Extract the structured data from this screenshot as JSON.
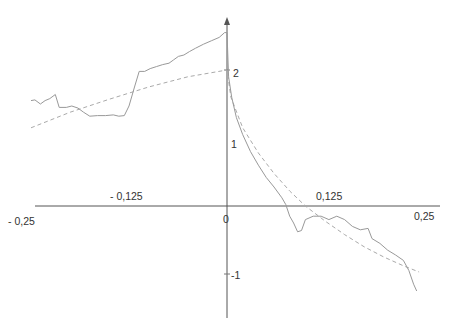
{
  "chart_data": {
    "type": "line",
    "title": "",
    "xlabel": "",
    "ylabel": "",
    "xlim": [
      -0.25,
      0.25
    ],
    "ylim": [
      -1.4,
      2.6
    ],
    "grid": false,
    "legend": null,
    "x_tick_labels": [
      "- 0,25",
      "- 0,125",
      "0",
      "0,125",
      "0,25"
    ],
    "y_tick_labels": [
      "2",
      "1",
      "-1"
    ],
    "series": [
      {
        "name": "observed path",
        "style": "solid",
        "color": "#9a9a9a",
        "points": [
          [
            -0.25,
            1.55
          ],
          [
            -0.245,
            1.56
          ],
          [
            -0.238,
            1.5
          ],
          [
            -0.232,
            1.55
          ],
          [
            -0.226,
            1.58
          ],
          [
            -0.219,
            1.64
          ],
          [
            -0.214,
            1.45
          ],
          [
            -0.205,
            1.45
          ],
          [
            -0.198,
            1.47
          ],
          [
            -0.19,
            1.44
          ],
          [
            -0.183,
            1.38
          ],
          [
            -0.175,
            1.32
          ],
          [
            -0.165,
            1.33
          ],
          [
            -0.155,
            1.33
          ],
          [
            -0.145,
            1.34
          ],
          [
            -0.138,
            1.32
          ],
          [
            -0.131,
            1.33
          ],
          [
            -0.125,
            1.47
          ],
          [
            -0.118,
            1.75
          ],
          [
            -0.112,
            1.98
          ],
          [
            -0.105,
            1.98
          ],
          [
            -0.098,
            2.02
          ],
          [
            -0.09,
            2.05
          ],
          [
            -0.082,
            2.08
          ],
          [
            -0.074,
            2.1
          ],
          [
            -0.068,
            2.15
          ],
          [
            -0.062,
            2.2
          ],
          [
            -0.055,
            2.22
          ],
          [
            -0.048,
            2.27
          ],
          [
            -0.04,
            2.32
          ],
          [
            -0.03,
            2.38
          ],
          [
            -0.02,
            2.43
          ],
          [
            -0.01,
            2.48
          ],
          [
            -0.003,
            2.55
          ],
          [
            0.0,
            2.55
          ],
          [
            0.002,
            1.9
          ],
          [
            0.006,
            1.6
          ],
          [
            0.012,
            1.3
          ],
          [
            0.02,
            1.05
          ],
          [
            0.03,
            0.8
          ],
          [
            0.04,
            0.6
          ],
          [
            0.05,
            0.42
          ],
          [
            0.06,
            0.28
          ],
          [
            0.07,
            0.12
          ],
          [
            0.075,
            0.02
          ],
          [
            0.08,
            -0.15
          ],
          [
            0.085,
            -0.25
          ],
          [
            0.09,
            -0.38
          ],
          [
            0.095,
            -0.36
          ],
          [
            0.1,
            -0.2
          ],
          [
            0.11,
            -0.15
          ],
          [
            0.12,
            -0.15
          ],
          [
            0.13,
            -0.2
          ],
          [
            0.14,
            -0.15
          ],
          [
            0.15,
            -0.2
          ],
          [
            0.16,
            -0.3
          ],
          [
            0.17,
            -0.35
          ],
          [
            0.18,
            -0.33
          ],
          [
            0.185,
            -0.48
          ],
          [
            0.195,
            -0.55
          ],
          [
            0.205,
            -0.65
          ],
          [
            0.215,
            -0.72
          ],
          [
            0.225,
            -0.8
          ],
          [
            0.232,
            -0.95
          ],
          [
            0.238,
            -1.15
          ],
          [
            0.242,
            -1.25
          ]
        ]
      },
      {
        "name": "fitted curve",
        "style": "dashed",
        "color": "#b0b0b0",
        "points": [
          [
            -0.25,
            1.15
          ],
          [
            -0.2,
            1.38
          ],
          [
            -0.15,
            1.57
          ],
          [
            -0.1,
            1.75
          ],
          [
            -0.05,
            1.9
          ],
          [
            0.0,
            2.0
          ],
          [
            0.005,
            1.6
          ],
          [
            0.02,
            1.15
          ],
          [
            0.04,
            0.78
          ],
          [
            0.06,
            0.48
          ],
          [
            0.08,
            0.22
          ],
          [
            0.1,
            0.0
          ],
          [
            0.125,
            -0.22
          ],
          [
            0.15,
            -0.42
          ],
          [
            0.175,
            -0.6
          ],
          [
            0.2,
            -0.75
          ],
          [
            0.225,
            -0.88
          ],
          [
            0.245,
            -0.97
          ]
        ]
      }
    ]
  },
  "axes": {
    "origin_px": [
      227,
      206
    ],
    "x_px_per_unit": 784,
    "y_px_per_unit": 68,
    "x_axis_extent_px": [
      35,
      440
    ],
    "y_axis_extent_px": [
      20,
      318
    ],
    "axis_color": "#555555"
  },
  "labels": {
    "x_neg_025": "- 0,25",
    "x_neg_0125": "- 0,125",
    "x_zero": "0",
    "x_pos_0125": "0,125",
    "x_pos_025": "0,25",
    "y_2": "2",
    "y_1": "1",
    "y_neg1": "-1"
  }
}
